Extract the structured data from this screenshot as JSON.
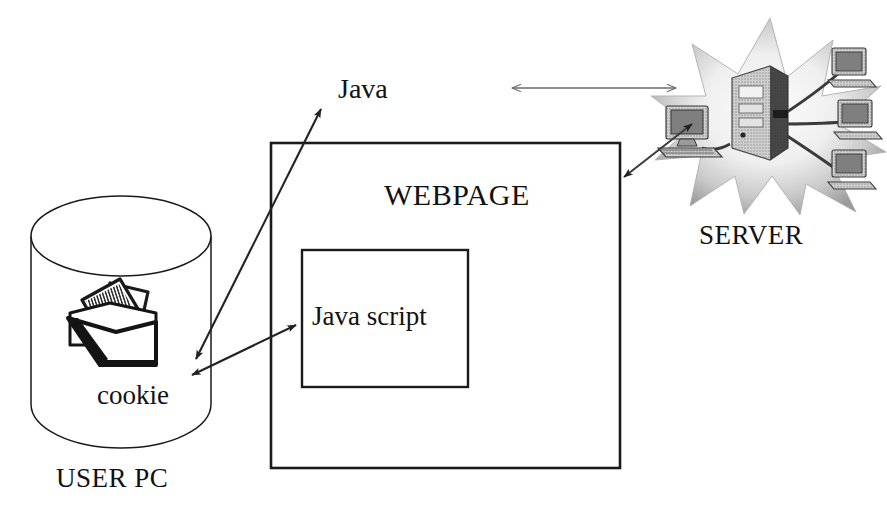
{
  "diagram": {
    "background_color": "#ffffff",
    "line_color": "#1a1a1a",
    "arrow_color": "#2b2b2b",
    "text_color": "#111111"
  },
  "nodes": {
    "user_pc": {
      "label": "USER PC",
      "shape": "cylinder",
      "icon_name": "database-cylinder-icon",
      "contains_label": "cookie",
      "contains_icon_name": "cookie-folder-icon"
    },
    "webpage": {
      "label": "WEBPAGE",
      "shape": "rectangle",
      "inner": {
        "label": "Java script",
        "shape": "rectangle"
      }
    },
    "server": {
      "label": "SERVER",
      "shape": "starburst",
      "icon_name": "server-starburst-icon"
    }
  },
  "connections": [
    {
      "id": "java-link",
      "label": "Java",
      "from": "cookie",
      "to": "java-label",
      "arrow": "double"
    },
    {
      "id": "javascript-link",
      "label": "",
      "from": "cookie",
      "to": "java-script-box",
      "arrow": "double"
    },
    {
      "id": "webpage-server-top-link",
      "label": "",
      "from": "webpage",
      "to": "server",
      "arrow": "double"
    },
    {
      "id": "webpage-server-diagonal-link",
      "label": "",
      "from": "webpage",
      "to": "server",
      "arrow": "double"
    }
  ]
}
